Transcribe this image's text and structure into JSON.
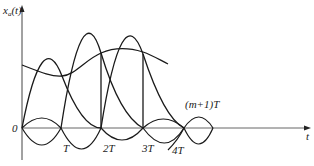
{
  "diagram": {
    "y_axis_label": "x",
    "y_axis_sub": "a",
    "y_axis_arg": "(t)",
    "x_axis_label": "t",
    "origin_label": "0",
    "tick_labels": [
      "T",
      "2T",
      "3T",
      "4T"
    ],
    "annotation": "(m+1)T",
    "colors": {
      "line": "#1a1a1a",
      "axis": "#555555",
      "background": "#ffffff"
    }
  }
}
